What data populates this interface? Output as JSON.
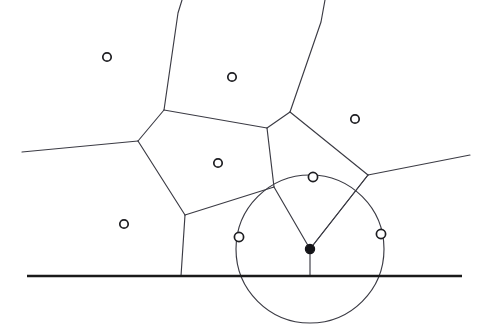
{
  "figure": {
    "width": 486,
    "height": 336,
    "background_color": "#ffffff",
    "edge_color": "#3b3b44",
    "baseline_color": "#1a1a1a",
    "site_marker_fill": "#ffffff",
    "site_marker_stroke": "#1e1e22",
    "center_marker_color": "#141418"
  },
  "chart_data": {
    "type": "scatter",
    "xlabel": "",
    "ylabel": "",
    "xlim": [
      0,
      486
    ],
    "ylim": [
      0,
      336
    ],
    "grid": false,
    "legend": "none",
    "sites": [
      {
        "name": "site-upper-left",
        "x": 107,
        "y": 57,
        "radius": 4.2,
        "filled": false
      },
      {
        "name": "site-upper-middle",
        "x": 232,
        "y": 77,
        "radius": 4.2,
        "filled": false
      },
      {
        "name": "site-upper-right",
        "x": 355,
        "y": 119,
        "radius": 4.2,
        "filled": false
      },
      {
        "name": "site-center",
        "x": 218,
        "y": 163,
        "radius": 4.2,
        "filled": false
      },
      {
        "name": "site-lower-left",
        "x": 124,
        "y": 224,
        "radius": 4.2,
        "filled": false
      },
      {
        "name": "site-circle-top",
        "x": 313,
        "y": 177,
        "radius": 4.6,
        "filled": false
      },
      {
        "name": "site-circle-left",
        "x": 239,
        "y": 237,
        "radius": 4.6,
        "filled": false
      },
      {
        "name": "site-circle-right",
        "x": 381,
        "y": 234,
        "radius": 4.6,
        "filled": false
      }
    ],
    "voronoi_vertex": {
      "name": "voronoi-vertex-circle-center",
      "x": 310,
      "y": 249,
      "radius": 4.6,
      "filled": true
    },
    "empty_circle": {
      "cx": 310,
      "cy": 249,
      "r": 74
    },
    "baseline": {
      "x1": 27,
      "y1": 276,
      "x2": 462,
      "y2": 276
    },
    "edges": [
      {
        "name": "edge-left-boundary",
        "points": "22,152 138,141"
      },
      {
        "name": "edge-left-vertex-to-upper-vertex",
        "points": "138,141 164,110"
      },
      {
        "name": "edge-upper-vertex-to-top-exit",
        "points": "164,110 178,13 182,0"
      },
      {
        "name": "edge-upper-vertex-to-right-vertex",
        "points": "164,110 267,128"
      },
      {
        "name": "edge-left-vertex-to-lower-vertex",
        "points": "138,141 185,215"
      },
      {
        "name": "edge-lower-vertex-to-baseline",
        "points": "185,215 181,276"
      },
      {
        "name": "edge-lower-vertex-to-triple-point",
        "points": "185,215 274,187"
      },
      {
        "name": "edge-right-vertex-to-triple-point",
        "points": "267,128 274,187"
      },
      {
        "name": "edge-right-vertex-to-apex",
        "points": "267,128 290,112"
      },
      {
        "name": "edge-apex-to-top-exit",
        "points": "290,112 321,22 325,0"
      },
      {
        "name": "edge-apex-to-far-right-vertex",
        "points": "290,112 368,175"
      },
      {
        "name": "edge-far-right-vertex-to-right-edge",
        "points": "368,175 470,155"
      },
      {
        "name": "edge-far-right-vertex-to-circle-center",
        "points": "368,175 310,249"
      }
    ],
    "spokes": [
      {
        "name": "spoke-to-left-site",
        "points": "310,249 274,187"
      },
      {
        "name": "spoke-to-top-site",
        "points": "310,249 368,175"
      },
      {
        "name": "spoke-to-baseline",
        "points": "310,249 310,276"
      }
    ]
  }
}
